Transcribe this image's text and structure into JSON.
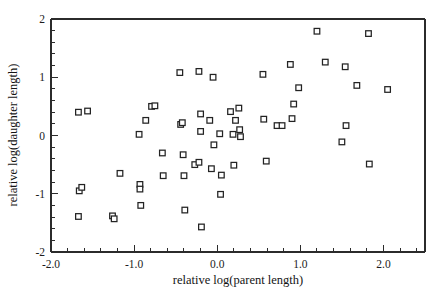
{
  "chart_data": {
    "type": "scatter",
    "title": "",
    "xlabel": "relative log(parent length)",
    "ylabel": "relative log(daughter length)",
    "xlim": [
      -2.0,
      2.5
    ],
    "ylim": [
      -2.0,
      2.0
    ],
    "xticks": [
      -2.0,
      -1.0,
      0.0,
      1.0,
      2.0
    ],
    "xtick_labels": [
      "-2.0",
      "-1.0",
      "0.0",
      "1.0",
      "2.0"
    ],
    "yticks": [
      -2,
      -1,
      0,
      1,
      2
    ],
    "ytick_labels": [
      "-2",
      "-1",
      "0",
      "1",
      "2"
    ],
    "minor_ticks_per_interval": 5,
    "grid": false,
    "legend": null,
    "marker": "open-square",
    "marker_color": "#232323",
    "marker_fill": "#ffffff",
    "background": "#ffffff",
    "points": [
      [
        -1.67,
        0.4
      ],
      [
        -1.56,
        0.42
      ],
      [
        -1.66,
        -0.95
      ],
      [
        -1.63,
        -0.89
      ],
      [
        -1.67,
        -1.39
      ],
      [
        -1.26,
        -1.38
      ],
      [
        -1.24,
        -1.43
      ],
      [
        -1.17,
        -0.65
      ],
      [
        -0.94,
        0.02
      ],
      [
        -0.93,
        -0.84
      ],
      [
        -0.93,
        -0.92
      ],
      [
        -0.92,
        -1.2
      ],
      [
        -0.86,
        0.26
      ],
      [
        -0.79,
        0.5
      ],
      [
        -0.75,
        0.51
      ],
      [
        -0.66,
        -0.3
      ],
      [
        -0.65,
        -0.69
      ],
      [
        -0.45,
        1.08
      ],
      [
        -0.44,
        0.19
      ],
      [
        -0.42,
        0.22
      ],
      [
        -0.41,
        -0.33
      ],
      [
        -0.4,
        -0.69
      ],
      [
        -0.39,
        -1.28
      ],
      [
        -0.27,
        -0.5
      ],
      [
        -0.22,
        1.1
      ],
      [
        -0.22,
        -0.46
      ],
      [
        -0.2,
        0.37
      ],
      [
        -0.2,
        0.07
      ],
      [
        -0.19,
        -1.57
      ],
      [
        -0.09,
        0.26
      ],
      [
        -0.07,
        -0.57
      ],
      [
        -0.05,
        1.0
      ],
      [
        -0.04,
        -0.16
      ],
      [
        0.03,
        0.03
      ],
      [
        0.04,
        -1.01
      ],
      [
        0.05,
        -0.68
      ],
      [
        0.16,
        0.41
      ],
      [
        0.19,
        0.02
      ],
      [
        0.2,
        -0.51
      ],
      [
        0.22,
        0.26
      ],
      [
        0.26,
        0.47
      ],
      [
        0.27,
        0.1
      ],
      [
        0.28,
        -0.02
      ],
      [
        0.55,
        1.05
      ],
      [
        0.56,
        0.28
      ],
      [
        0.59,
        -0.44
      ],
      [
        0.72,
        0.17
      ],
      [
        0.78,
        0.17
      ],
      [
        0.88,
        1.22
      ],
      [
        0.9,
        0.29
      ],
      [
        0.92,
        0.54
      ],
      [
        0.98,
        0.82
      ],
      [
        1.2,
        1.79
      ],
      [
        1.3,
        1.26
      ],
      [
        1.5,
        -0.11
      ],
      [
        1.54,
        1.18
      ],
      [
        1.55,
        0.17
      ],
      [
        1.68,
        0.86
      ],
      [
        1.82,
        1.75
      ],
      [
        1.83,
        -0.49
      ],
      [
        2.05,
        0.79
      ]
    ]
  }
}
